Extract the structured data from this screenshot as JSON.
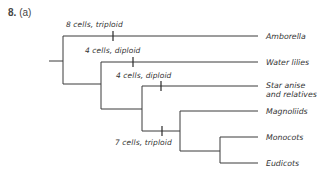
{
  "question": {
    "number": "8.",
    "part": "(a)"
  },
  "tree": {
    "taxa": [
      {
        "name": "Amborella",
        "lines": [
          "Amborella"
        ]
      },
      {
        "name": "Water lilies",
        "lines": [
          "Water lilies"
        ]
      },
      {
        "name": "Star anise and relatives",
        "lines": [
          "Star anise",
          "and relatives"
        ]
      },
      {
        "name": "Magnoliids",
        "lines": [
          "Magnoliids"
        ]
      },
      {
        "name": "Monocots",
        "lines": [
          "Monocots"
        ]
      },
      {
        "name": "Eudicots",
        "lines": [
          "Eudicots"
        ]
      }
    ],
    "character_changes": [
      {
        "label": "8 cells, triploid",
        "on_branch": "Rest of angiosperms (excluding Amborella)"
      },
      {
        "label": "4 cells, diploid",
        "on_branch": "Water lilies + remaining clade"
      },
      {
        "label": "4 cells, diploid",
        "on_branch": "Star anise and relatives"
      },
      {
        "label": "7 cells, triploid",
        "on_branch": "Magnoliids + Monocots + Eudicots"
      }
    ]
  }
}
